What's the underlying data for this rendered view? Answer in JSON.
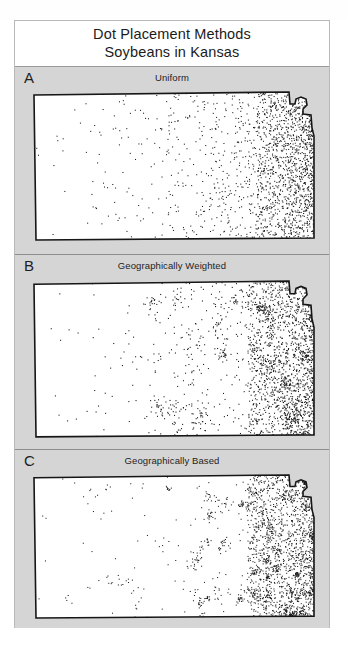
{
  "figure": {
    "title_line1": "Dot Placement Methods",
    "title_line2": "Soybeans in Kansas",
    "background_color": "#d5d5d5",
    "frame_color": "#b9b9b9",
    "map_fill_color": "#ffffff",
    "map_outline_color": "#161616",
    "dot_color": "#1a1a1a"
  },
  "panels": [
    {
      "letter": "A",
      "subtitle": "Uniform",
      "method": "uniform",
      "description": "Dots placed uniformly at random within each county"
    },
    {
      "letter": "B",
      "subtitle": "Geographically Weighted",
      "method": "geographically-weighted",
      "description": "Dots placed with probability weighted by geography"
    },
    {
      "letter": "C",
      "subtitle": "Geographically Based",
      "method": "geographically-based",
      "description": "Dots placed at geographically based locations forming clusters"
    }
  ],
  "chart_data": {
    "type": "scatter",
    "subtitle": "Soybeans in Kansas",
    "xlabel": "",
    "ylabel": "",
    "grid": false,
    "legend": "none",
    "region": "Kansas",
    "commodity": "Soybeans",
    "panel_labels": [
      "A",
      "B",
      "C"
    ],
    "panel_titles": [
      "Uniform",
      "Geographically Weighted",
      "Geographically Based"
    ],
    "xlim": [
      0,
      286
    ],
    "ylim": [
      0,
      152
    ],
    "note": "Dot density increases strongly toward eastern Kansas; western counties nearly empty.",
    "density_by_longitude_band": {
      "bands": [
        "far-west",
        "west",
        "central",
        "east-central",
        "east",
        "far-east"
      ],
      "relative_density": [
        0.02,
        0.06,
        0.18,
        0.45,
        0.85,
        1.0
      ]
    },
    "series": [
      {
        "name": "Uniform",
        "panel": "A",
        "approx_dot_count": 900,
        "placement": "uniform-random-in-county"
      },
      {
        "name": "Geographically Weighted",
        "panel": "B",
        "approx_dot_count": 1000,
        "placement": "weighted-random-in-county"
      },
      {
        "name": "Geographically Based",
        "panel": "C",
        "approx_dot_count": 1000,
        "placement": "clustered-at-field-locations"
      }
    ]
  }
}
